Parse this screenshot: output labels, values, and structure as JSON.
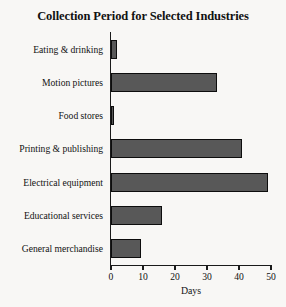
{
  "chart_data": {
    "type": "bar",
    "orientation": "horizontal",
    "title": "Collection Period for Selected Industries",
    "xlabel": "Days",
    "ylabel": "",
    "xlim": [
      0,
      50
    ],
    "xticks": [
      0,
      10,
      20,
      30,
      40,
      50
    ],
    "xtick_labels": [
      "0",
      "10",
      "20",
      "30",
      "40",
      "50"
    ],
    "grid": false,
    "legend": false,
    "categories": [
      "Eating & drinking",
      "Motion pictures",
      "Food stores",
      "Printing & publishing",
      "Electrical equipment",
      "Educational services",
      "General merchandise"
    ],
    "values": [
      2,
      33,
      1,
      41,
      49,
      16,
      9.5
    ],
    "bar_color": "#585858",
    "bar_edge_color": "#0d0d0d",
    "background_color": "#f8f7f5",
    "axis_color": "#1a1a1a"
  }
}
